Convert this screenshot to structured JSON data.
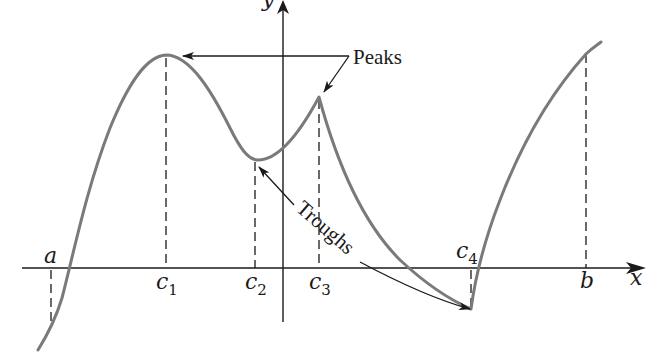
{
  "figure": {
    "axes": {
      "x_label": "x",
      "y_label": "y"
    },
    "points": {
      "a": "a",
      "b": "b",
      "c1": {
        "base": "c",
        "sub": "1"
      },
      "c2": {
        "base": "c",
        "sub": "2"
      },
      "c3": {
        "base": "c",
        "sub": "3"
      },
      "c4": {
        "base": "c",
        "sub": "4"
      }
    },
    "annotations": {
      "peaks": "Peaks",
      "troughs": "Troughs"
    },
    "colors": {
      "curve": "#7a7a7a",
      "ink": "#1a1a1a",
      "background": "#ffffff"
    }
  }
}
